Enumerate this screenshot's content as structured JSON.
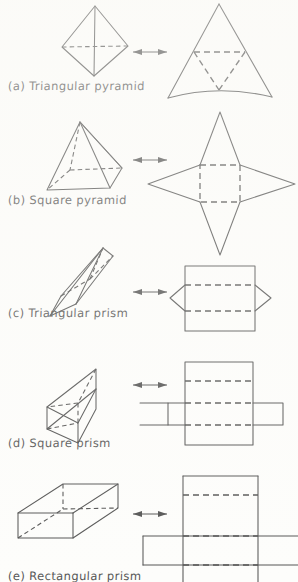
{
  "figure": {
    "ink_color": "#2b2b2b",
    "paper_color": "#fdfdfb",
    "rows": [
      {
        "id": "a",
        "tag": "(a)",
        "name": "Triangular pyramid",
        "solid": "triangular-pyramid",
        "net": "triangular-pyramid-net",
        "arrow": "double-headed-arrow"
      },
      {
        "id": "b",
        "tag": "(b)",
        "name": "Square pyramid",
        "solid": "square-pyramid",
        "net": "square-pyramid-net",
        "arrow": "double-headed-arrow"
      },
      {
        "id": "c",
        "tag": "(c)",
        "name": "Triangular prism",
        "solid": "triangular-prism",
        "net": "triangular-prism-net",
        "arrow": "double-headed-arrow"
      },
      {
        "id": "d",
        "tag": "(d)",
        "name": "Square prism",
        "solid": "square-prism",
        "net": "square-prism-net",
        "arrow": "double-headed-arrow"
      },
      {
        "id": "e",
        "tag": "(e)",
        "name": "Rectangular prism",
        "solid": "rectangular-prism",
        "net": "rectangular-prism-net",
        "arrow": "double-headed-arrow"
      }
    ]
  }
}
